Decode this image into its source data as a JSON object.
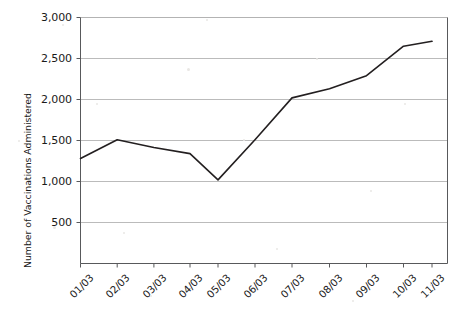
{
  "chart_data": {
    "type": "line",
    "title": "",
    "subtitle": "",
    "xlabel": "",
    "ylabel": "Number of Vaccinations Administered",
    "categories": [
      "01/03",
      "02/03",
      "03/03",
      "04/03",
      "05/03",
      "06/03",
      "07/03",
      "08/03",
      "09/03",
      "10/03",
      "11/03"
    ],
    "values": [
      1280,
      1510,
      1415,
      1340,
      1020,
      1510,
      2020,
      2130,
      2290,
      2650,
      2710
    ],
    "series": [
      {
        "name": "Vaccinations Administered",
        "values": [
          1280,
          1510,
          1415,
          1340,
          1020,
          1510,
          2020,
          2130,
          2290,
          2650,
          2710
        ]
      }
    ],
    "ylim": [
      0,
      3000
    ],
    "yticks": [
      500,
      1000,
      1500,
      2000,
      2500,
      3000
    ],
    "ytick_labels": [
      "500",
      "1,000",
      "1,500",
      "2,000",
      "2,500",
      "3,000"
    ],
    "grid": "horizontal",
    "legend": "none",
    "line_color": "#231f20",
    "grid_color": "#b3b3b3",
    "axis_color": "#58595b",
    "background_color": "#ffffff"
  },
  "axes": {
    "y_axis_title": "Number of Vaccinations Administered",
    "x_axis_title": ""
  }
}
